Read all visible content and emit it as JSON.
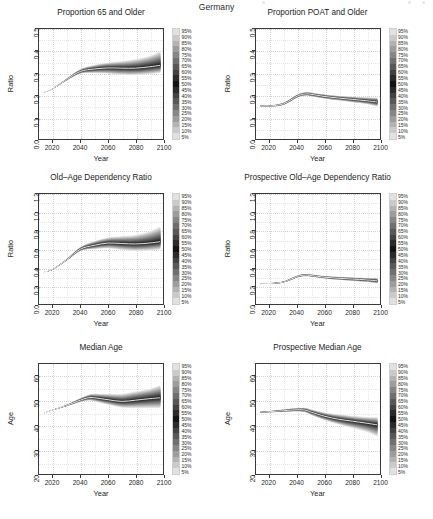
{
  "figure": {
    "main_title": "Germany",
    "background": "#ffffff",
    "axis_color": "#3a3a3a",
    "grid_color": "#d2d2d2",
    "median_line_color": "#ffffff",
    "band_color_dark": "#1a1a1a",
    "band_color_light": "#e0e0e0"
  },
  "legend": {
    "labels": [
      "95%",
      "90%",
      "85%",
      "80%",
      "75%",
      "70%",
      "65%",
      "60%",
      "55%",
      "50%",
      "45%",
      "40%",
      "35%",
      "30%",
      "25%",
      "20%",
      "15%",
      "10%",
      "5%"
    ],
    "order": "top-to-bottom",
    "description": "probabilistic projection interval shading"
  },
  "chart_data": [
    {
      "type": "area",
      "id": "proportion-65-and-older",
      "title": "Proportion 65 and Older",
      "xlabel": "Year",
      "ylabel": "Ratio",
      "xlim": [
        2010,
        2100
      ],
      "ylim": [
        0.0,
        0.5
      ],
      "xticks": [
        2020,
        2040,
        2060,
        2080,
        2100
      ],
      "yticks": [
        "0.0",
        "0.1",
        "0.2",
        "0.3",
        "0.4",
        "0.5"
      ],
      "grid": true,
      "legend_position": "right",
      "x": [
        2013,
        2020,
        2030,
        2040,
        2050,
        2060,
        2070,
        2080,
        2090,
        2098
      ],
      "series": [
        {
          "name": "median",
          "values": [
            0.211,
            0.228,
            0.27,
            0.307,
            0.318,
            0.323,
            0.322,
            0.322,
            0.328,
            0.335
          ]
        },
        {
          "name": "p5",
          "values": [
            0.211,
            0.227,
            0.266,
            0.297,
            0.3,
            0.297,
            0.292,
            0.291,
            0.295,
            0.3
          ]
        },
        {
          "name": "p95",
          "values": [
            0.211,
            0.229,
            0.274,
            0.317,
            0.336,
            0.347,
            0.353,
            0.362,
            0.377,
            0.398
          ]
        }
      ]
    },
    {
      "type": "area",
      "id": "proportion-poat-and-older",
      "title": "Proportion POAT and Older",
      "xlabel": "Year",
      "ylabel": "Ratio",
      "xlim": [
        2010,
        2100
      ],
      "ylim": [
        0.0,
        0.5
      ],
      "xticks": [
        2020,
        2040,
        2060,
        2080,
        2100
      ],
      "yticks": [
        "0.0",
        "0.1",
        "0.2",
        "0.3",
        "0.4",
        "0.5"
      ],
      "grid": true,
      "legend_position": "right",
      "x": [
        2013,
        2020,
        2030,
        2040,
        2046,
        2050,
        2060,
        2070,
        2080,
        2090,
        2098
      ],
      "series": [
        {
          "name": "median",
          "values": [
            0.15,
            0.15,
            0.16,
            0.195,
            0.205,
            0.203,
            0.193,
            0.186,
            0.18,
            0.174,
            0.168
          ]
        },
        {
          "name": "p5",
          "values": [
            0.148,
            0.147,
            0.155,
            0.188,
            0.197,
            0.194,
            0.183,
            0.175,
            0.167,
            0.159,
            0.148
          ]
        },
        {
          "name": "p95",
          "values": [
            0.152,
            0.153,
            0.165,
            0.202,
            0.213,
            0.211,
            0.202,
            0.196,
            0.192,
            0.189,
            0.188
          ]
        }
      ]
    },
    {
      "type": "area",
      "id": "old-age-dependency-ratio",
      "title": "Old–Age Dependency Ratio",
      "xlabel": "Year",
      "ylabel": "Ratio",
      "xlim": [
        2010,
        2100
      ],
      "ylim": [
        0.0,
        1.2
      ],
      "xticks": [
        2020,
        2040,
        2060,
        2080,
        2100
      ],
      "yticks": [
        "0.0",
        "0.2",
        "0.4",
        "0.6",
        "0.8",
        "1.0",
        "1.2"
      ],
      "grid": true,
      "legend_position": "right",
      "x": [
        2013,
        2020,
        2030,
        2040,
        2050,
        2060,
        2070,
        2080,
        2090,
        2098
      ],
      "series": [
        {
          "name": "median",
          "values": [
            0.345,
            0.378,
            0.48,
            0.598,
            0.64,
            0.665,
            0.66,
            0.655,
            0.665,
            0.68
          ]
        },
        {
          "name": "p5",
          "values": [
            0.345,
            0.375,
            0.472,
            0.578,
            0.6,
            0.608,
            0.592,
            0.58,
            0.585,
            0.595
          ]
        },
        {
          "name": "p95",
          "values": [
            0.345,
            0.381,
            0.489,
            0.62,
            0.685,
            0.724,
            0.738,
            0.752,
            0.79,
            0.845
          ]
        }
      ]
    },
    {
      "type": "area",
      "id": "prospective-old-age-dependency-ratio",
      "title": "Prospective Old–Age Dependency Ratio",
      "xlabel": "Year",
      "ylabel": "Ratio",
      "xlim": [
        2010,
        2100
      ],
      "ylim": [
        0.0,
        1.2
      ],
      "xticks": [
        2020,
        2040,
        2060,
        2080,
        2100
      ],
      "yticks": [
        "0.0",
        "0.2",
        "0.4",
        "0.6",
        "0.8",
        "1.0",
        "1.2"
      ],
      "grid": true,
      "legend_position": "right",
      "x": [
        2013,
        2020,
        2030,
        2040,
        2046,
        2050,
        2060,
        2070,
        2080,
        2090,
        2098
      ],
      "series": [
        {
          "name": "median",
          "values": [
            0.222,
            0.224,
            0.24,
            0.3,
            0.315,
            0.31,
            0.292,
            0.28,
            0.272,
            0.263,
            0.253
          ]
        },
        {
          "name": "p5",
          "values": [
            0.219,
            0.22,
            0.233,
            0.29,
            0.303,
            0.297,
            0.278,
            0.264,
            0.252,
            0.24,
            0.225
          ]
        },
        {
          "name": "p95",
          "values": [
            0.225,
            0.229,
            0.248,
            0.311,
            0.327,
            0.322,
            0.305,
            0.296,
            0.29,
            0.285,
            0.283
          ]
        }
      ]
    },
    {
      "type": "area",
      "id": "median-age",
      "title": "Median Age",
      "xlabel": "Year",
      "ylabel": "Age",
      "xlim": [
        2010,
        2100
      ],
      "ylim": [
        20,
        65
      ],
      "xticks": [
        2020,
        2040,
        2060,
        2080,
        2100
      ],
      "yticks": [
        "20",
        "30",
        "40",
        "50",
        "60"
      ],
      "grid": true,
      "legend_position": "right",
      "x": [
        2013,
        2020,
        2030,
        2040,
        2046,
        2050,
        2060,
        2070,
        2080,
        2090,
        2098
      ],
      "series": [
        {
          "name": "median",
          "values": [
            44.8,
            46.2,
            48.0,
            50.2,
            51.2,
            51.2,
            50.4,
            49.7,
            50.2,
            50.8,
            51.2
          ]
        },
        {
          "name": "p5",
          "values": [
            44.8,
            46.1,
            47.7,
            49.5,
            50.1,
            49.8,
            48.4,
            47.2,
            47.0,
            47.0,
            47.0
          ]
        },
        {
          "name": "p95",
          "values": [
            44.8,
            46.3,
            48.3,
            51.0,
            52.4,
            52.8,
            52.7,
            52.7,
            53.7,
            54.8,
            56.3
          ]
        }
      ]
    },
    {
      "type": "area",
      "id": "prospective-median-age",
      "title": "Prospective Median Age",
      "xlabel": "Year",
      "ylabel": "Age",
      "xlim": [
        2010,
        2100
      ],
      "ylim": [
        20,
        65
      ],
      "xticks": [
        2020,
        2040,
        2060,
        2080,
        2100
      ],
      "yticks": [
        "20",
        "30",
        "40",
        "50",
        "60"
      ],
      "grid": true,
      "legend_position": "right",
      "x": [
        2013,
        2020,
        2030,
        2040,
        2046,
        2050,
        2060,
        2070,
        2080,
        2090,
        2098
      ],
      "series": [
        {
          "name": "median",
          "values": [
            45.3,
            45.5,
            45.9,
            46.3,
            46.1,
            45.3,
            43.6,
            42.4,
            41.6,
            40.8,
            40.1
          ]
        },
        {
          "name": "p5",
          "values": [
            45.1,
            45.2,
            45.4,
            45.6,
            45.2,
            44.2,
            42.0,
            40.3,
            38.8,
            37.3,
            35.4
          ]
        },
        {
          "name": "p95",
          "values": [
            45.5,
            45.8,
            46.4,
            47.0,
            47.0,
            46.4,
            45.1,
            44.3,
            43.7,
            43.3,
            43.2
          ]
        }
      ]
    }
  ]
}
